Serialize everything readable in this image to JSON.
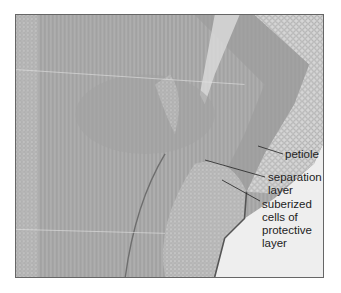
{
  "figure": {
    "labels": {
      "petiole": "petiole",
      "separation_layer": [
        "separation",
        "layer"
      ],
      "protective_layer": [
        "suberized",
        "cells of",
        "protective",
        "layer"
      ]
    },
    "colors": {
      "background": "#ffffff",
      "tissue_dark": "#8c8c8c",
      "tissue_mid": "#b3b3b3",
      "tissue_light": "#d9d9d9",
      "empty_area": "#eeeeee",
      "leader_line": "#222222"
    }
  }
}
